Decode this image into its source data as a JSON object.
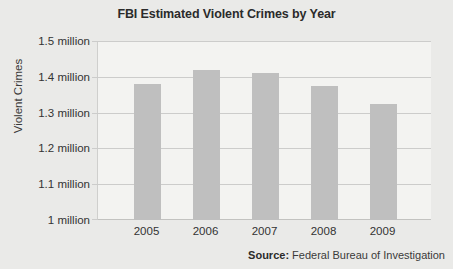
{
  "chart_data": {
    "type": "bar",
    "title": "FBI Estimated Violent Crimes by Year",
    "xlabel": "",
    "ylabel": "Violent Crimes",
    "categories": [
      "2005",
      "2006",
      "2007",
      "2008",
      "2009"
    ],
    "values": [
      1380000,
      1420000,
      1410000,
      1375000,
      1325000
    ],
    "value_labels": [
      "1.38 million",
      "1.42 million",
      "1.41 million",
      "1.375 million",
      "1.325 million"
    ],
    "ylim": [
      1000000,
      1500000
    ],
    "yticks": [
      1000000,
      1100000,
      1200000,
      1300000,
      1400000,
      1500000
    ],
    "ytick_labels": [
      "1 million",
      "1.1 million",
      "1.2 million",
      "1.3 million",
      "1.4 million",
      "1.5 million"
    ],
    "grid": "horizontal",
    "legend": "none",
    "bar_color": "#bfbfbf",
    "plot_background": "#f3f3f1",
    "figure_background": "#eaeae8",
    "gridline_color": "#cccccb"
  },
  "source": {
    "label": "Source:",
    "text": " Federal Bureau of Investigation"
  }
}
